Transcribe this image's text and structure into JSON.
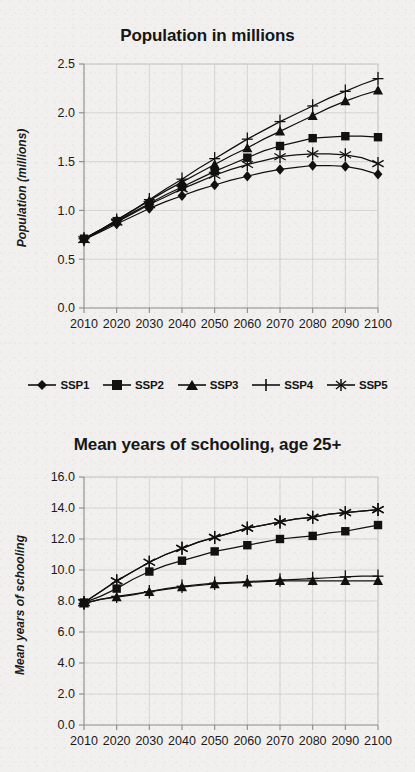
{
  "figure": {
    "background_color": "#f1f0ee",
    "ink_color": "#111111",
    "grid_color": "#c9c9c9",
    "axis_color": "#8a8a8a"
  },
  "legend": {
    "position": "below-first-chart",
    "items": [
      {
        "label": "SSP1",
        "marker": "diamond"
      },
      {
        "label": "SSP2",
        "marker": "square"
      },
      {
        "label": "SSP3",
        "marker": "triangle"
      },
      {
        "label": "SSP4",
        "marker": "plus"
      },
      {
        "label": "SSP5",
        "marker": "asterisk"
      }
    ]
  },
  "chart_data": [
    {
      "id": "population",
      "type": "line",
      "title": "Population in millions",
      "xlabel": "",
      "ylabel": "Population (millions)",
      "x": [
        2010,
        2015,
        2020,
        2025,
        2030,
        2035,
        2040,
        2045,
        2050,
        2055,
        2060,
        2065,
        2070,
        2075,
        2080,
        2085,
        2090,
        2095,
        2100
      ],
      "xticks": [
        2010,
        2020,
        2030,
        2040,
        2050,
        2060,
        2070,
        2080,
        2090,
        2100
      ],
      "xlim": [
        2010,
        2100
      ],
      "yticks": [
        0.0,
        0.5,
        1.0,
        1.5,
        2.0,
        2.5
      ],
      "ytick_labels": [
        "0.0",
        "0.5",
        "1.0",
        "1.5",
        "2.0",
        "2.5"
      ],
      "ylim": [
        0.0,
        2.5
      ],
      "grid": true,
      "legend": "below",
      "series": [
        {
          "name": "SSP1",
          "marker": "diamond",
          "values": [
            0.7,
            0.78,
            0.86,
            0.94,
            1.02,
            1.09,
            1.15,
            1.21,
            1.26,
            1.31,
            1.35,
            1.39,
            1.42,
            1.44,
            1.46,
            1.46,
            1.45,
            1.42,
            1.37
          ]
        },
        {
          "name": "SSP2",
          "marker": "square",
          "values": [
            0.71,
            0.8,
            0.89,
            0.98,
            1.07,
            1.16,
            1.24,
            1.32,
            1.4,
            1.47,
            1.54,
            1.61,
            1.66,
            1.7,
            1.74,
            1.75,
            1.76,
            1.76,
            1.75
          ]
        },
        {
          "name": "SSP3",
          "marker": "triangle",
          "values": [
            0.71,
            0.8,
            0.9,
            1.0,
            1.1,
            1.2,
            1.29,
            1.38,
            1.47,
            1.56,
            1.64,
            1.73,
            1.81,
            1.89,
            1.97,
            2.05,
            2.12,
            2.18,
            2.23
          ]
        },
        {
          "name": "SSP4",
          "marker": "plus",
          "values": [
            0.71,
            0.8,
            0.9,
            1.0,
            1.11,
            1.22,
            1.32,
            1.43,
            1.53,
            1.63,
            1.73,
            1.82,
            1.91,
            1.99,
            2.07,
            2.15,
            2.22,
            2.29,
            2.35
          ]
        },
        {
          "name": "SSP5",
          "marker": "asterisk",
          "values": [
            0.7,
            0.79,
            0.88,
            0.97,
            1.06,
            1.14,
            1.22,
            1.29,
            1.36,
            1.42,
            1.47,
            1.51,
            1.55,
            1.57,
            1.58,
            1.58,
            1.57,
            1.54,
            1.48
          ]
        }
      ]
    },
    {
      "id": "schooling",
      "type": "line",
      "title": "Mean years of schooling, age 25+",
      "xlabel": "",
      "ylabel": "Mean years of schooling",
      "x": [
        2010,
        2015,
        2020,
        2025,
        2030,
        2035,
        2040,
        2045,
        2050,
        2055,
        2060,
        2065,
        2070,
        2075,
        2080,
        2085,
        2090,
        2095,
        2100
      ],
      "xticks": [
        2010,
        2020,
        2030,
        2040,
        2050,
        2060,
        2070,
        2080,
        2090,
        2100
      ],
      "xlim": [
        2010,
        2100
      ],
      "yticks": [
        0.0,
        2.0,
        4.0,
        6.0,
        8.0,
        10.0,
        12.0,
        14.0,
        16.0
      ],
      "ytick_labels": [
        "0.0",
        "2.0",
        "4.0",
        "6.0",
        "8.0",
        "10.0",
        "12.0",
        "14.0",
        "16.0"
      ],
      "ylim": [
        0.0,
        16.0
      ],
      "grid": true,
      "legend": "none",
      "series": [
        {
          "name": "SSP1",
          "marker": "asterisk",
          "values": [
            7.9,
            8.6,
            9.3,
            9.9,
            10.5,
            11.0,
            11.4,
            11.8,
            12.1,
            12.4,
            12.7,
            12.9,
            13.1,
            13.3,
            13.4,
            13.6,
            13.7,
            13.8,
            13.9
          ]
        },
        {
          "name": "SSP2",
          "marker": "square",
          "values": [
            7.9,
            8.3,
            8.8,
            9.4,
            9.9,
            10.3,
            10.6,
            10.9,
            11.2,
            11.4,
            11.6,
            11.8,
            12.0,
            12.1,
            12.2,
            12.4,
            12.5,
            12.7,
            12.9
          ]
        },
        {
          "name": "SSP3",
          "marker": "triangle",
          "values": [
            7.85,
            8.1,
            8.25,
            8.4,
            8.6,
            8.75,
            8.9,
            9.0,
            9.1,
            9.15,
            9.2,
            9.25,
            9.3,
            9.3,
            9.3,
            9.3,
            9.3,
            9.3,
            9.3
          ]
        },
        {
          "name": "SSP4",
          "marker": "plus",
          "values": [
            7.85,
            8.1,
            8.3,
            8.45,
            8.6,
            8.8,
            8.95,
            9.05,
            9.15,
            9.2,
            9.25,
            9.3,
            9.35,
            9.4,
            9.45,
            9.5,
            9.55,
            9.6,
            9.6
          ]
        },
        {
          "name": "SSP5",
          "marker": "asterisk",
          "values": [
            7.9,
            8.6,
            9.3,
            9.9,
            10.5,
            11.0,
            11.4,
            11.8,
            12.1,
            12.4,
            12.7,
            12.9,
            13.1,
            13.3,
            13.4,
            13.6,
            13.7,
            13.8,
            13.9
          ]
        }
      ]
    }
  ]
}
